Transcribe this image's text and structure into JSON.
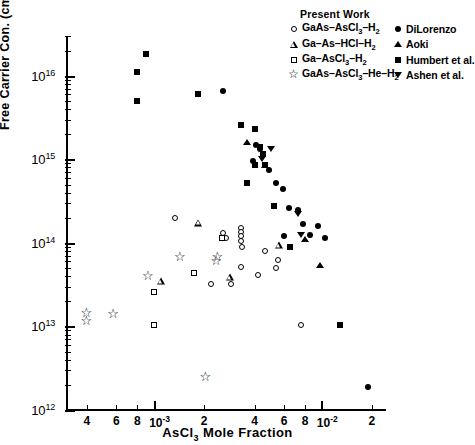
{
  "chart_data": {
    "type": "scatter",
    "title": "",
    "xlabel": "AsCl3 Mole Fraction",
    "ylabel": "Free Carrier Con. (cm-3) at 77 K",
    "xscale": "log",
    "yscale": "log",
    "xlim": [
      0.0003,
      0.024
    ],
    "ylim": [
      1000000000000.0,
      3e+16
    ],
    "grid": false,
    "legend_position": "top-right",
    "y_major_ticks": [
      "10^12",
      "10^13",
      "10^14",
      "10^15",
      "10^16"
    ],
    "y_tick_labels": [
      "10",
      "10",
      "10",
      "10",
      "10"
    ],
    "y_tick_exponents": [
      "12",
      "13",
      "14",
      "15",
      "16"
    ],
    "x_tick_labels": [
      "4",
      "6",
      "8",
      "10",
      "2",
      "4",
      "6",
      "8",
      "10",
      "2"
    ],
    "x_tick_exponents": [
      "",
      "",
      "",
      "-3",
      "",
      "",
      "",
      "",
      "-2",
      ""
    ],
    "series": [
      {
        "name": "GaAs-AsCl3-H2",
        "marker": "open-circle",
        "group": "Present Work",
        "points": [
          [
            0.00135,
            200000000000000.0
          ],
          [
            0.0026,
            130000000000000.0
          ],
          [
            0.0027,
            115000000000000.0
          ],
          [
            0.0033,
            150000000000000.0
          ],
          [
            0.0033,
            135000000000000.0
          ],
          [
            0.0033,
            120000000000000.0
          ],
          [
            0.0033,
            105000000000000.0
          ],
          [
            0.00335,
            90000000000000.0
          ],
          [
            0.0033,
            52000000000000.0
          ],
          [
            0.0046,
            80000000000000.0
          ],
          [
            0.0022,
            32000000000000.0
          ],
          [
            0.0029,
            32000000000000.0
          ],
          [
            0.0042,
            41000000000000.0
          ],
          [
            0.0055,
            62000000000000.0
          ],
          [
            0.0054,
            50000000000000.0
          ],
          [
            0.0076,
            10500000000000.0
          ]
        ]
      },
      {
        "name": "Ga-As-HCl-H2",
        "marker": "open-triangle",
        "group": "Present Work",
        "points": [
          [
            0.00185,
            175000000000000.0
          ],
          [
            0.0056,
            95000000000000.0
          ],
          [
            0.00285,
            39000000000000.0
          ],
          [
            0.0011,
            35000000000000.0
          ]
        ]
      },
      {
        "name": "Ga-AsCl3-H2",
        "marker": "open-square",
        "group": "Present Work",
        "points": [
          [
            0.001,
            26000000000000.0
          ],
          [
            0.001,
            10500000000000.0
          ],
          [
            0.00175,
            44000000000000.0
          ],
          [
            0.00255,
            115000000000000.0
          ]
        ]
      },
      {
        "name": "GaAs-AsCl3-He-H2",
        "marker": "open-star",
        "group": "Present Work",
        "points": [
          [
            0.00043,
            13000000000000.0
          ],
          [
            0.00043,
            10500000000000.0
          ],
          [
            0.00062,
            12500000000000.0
          ],
          [
            0.001,
            36000000000000.0
          ],
          [
            0.00155,
            60000000000000.0
          ],
          [
            0.00255,
            55000000000000.0
          ],
          [
            0.0026,
            60000000000000.0
          ],
          [
            0.0022,
            2200000000000.0
          ]
        ]
      },
      {
        "name": "DiLorenzo",
        "marker": "filled-circle",
        "group": "Other Work",
        "points": [
          [
            0.0026,
            6500000000000000.0
          ],
          [
            0.0041,
            1500000000000000.0
          ],
          [
            0.0043,
            1350000000000000.0
          ],
          [
            0.0039,
            950000000000000.0
          ],
          [
            0.0049,
            750000000000000.0
          ],
          [
            0.0054,
            520000000000000.0
          ],
          [
            0.0059,
            440000000000000.0
          ],
          [
            0.0064,
            260000000000000.0
          ],
          [
            0.0073,
            250000000000000.0
          ],
          [
            0.0078,
            170000000000000.0
          ],
          [
            0.0095,
            160000000000000.0
          ],
          [
            0.006,
            120000000000000.0
          ],
          [
            0.0086,
            125000000000000.0
          ],
          [
            0.0105,
            115000000000000.0
          ],
          [
            0.019,
            1900000000000.0
          ]
        ]
      },
      {
        "name": "Aoki",
        "marker": "filled-triangle",
        "group": "Other Work",
        "points": [
          [
            0.0036,
            1600000000000000.0
          ],
          [
            0.0046,
            850000000000000.0
          ],
          [
            0.008,
            110000000000000.0
          ],
          [
            0.0098,
            55000000000000.0
          ]
        ]
      },
      {
        "name": "Humbert et al.",
        "marker": "filled-square",
        "group": "Other Work",
        "points": [
          [
            0.0009,
            1.85e+16
          ],
          [
            0.0008,
            1.1e+16
          ],
          [
            0.0008,
            5000000000000000.0
          ],
          [
            0.00185,
            6000000000000000.0
          ],
          [
            0.0033,
            2600000000000000.0
          ],
          [
            0.004,
            2300000000000000.0
          ],
          [
            0.0043,
            1400000000000000.0
          ],
          [
            0.0045,
            1150000000000000.0
          ],
          [
            0.004,
            850000000000000.0
          ],
          [
            0.0046,
            850000000000000.0
          ],
          [
            0.0036,
            520000000000000.0
          ],
          [
            0.0052,
            280000000000000.0
          ],
          [
            0.0065,
            90000000000000.0
          ],
          [
            0.013,
            10500000000000.0
          ]
        ]
      },
      {
        "name": "Ashen et al.",
        "marker": "filled-down-triangle",
        "group": "Other Work",
        "points": [
          [
            0.0044,
            1000000000000000.0
          ],
          [
            0.005,
            1350000000000000.0
          ],
          [
            0.0073,
            220000000000000.0
          ],
          [
            0.0076,
            125000000000000.0
          ]
        ]
      }
    ]
  },
  "legend": {
    "title": "Present Work",
    "left_items": [
      {
        "symbol": "open-circle",
        "label": "GaAs-AsCl3-H2"
      },
      {
        "symbol": "open-triangle",
        "label": "Ga-As-HCl-H2"
      },
      {
        "symbol": "open-square",
        "label": "Ga-AsCl3-H2"
      },
      {
        "symbol": "open-star",
        "label": "GaAs-AsCl3-He-H2"
      }
    ],
    "right_items": [
      {
        "symbol": "filled-circle",
        "label": "DiLorenzo"
      },
      {
        "symbol": "filled-triangle",
        "label": "Aoki"
      },
      {
        "symbol": "filled-square",
        "label": "Humbert et al."
      },
      {
        "symbol": "filled-down-triangle",
        "label": "Ashen et al."
      }
    ]
  },
  "colors": {
    "foreground": "#000000",
    "background": "#ffffff"
  }
}
